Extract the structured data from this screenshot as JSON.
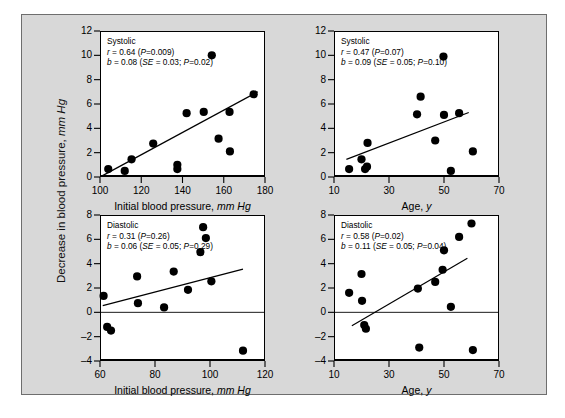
{
  "figure": {
    "y_axis_title_plain": "Decrease in blood pressure, ",
    "y_axis_title_italic": "mm Hg",
    "background_color": "#d8d8d8",
    "plot_background_color": "#ffffff",
    "point_color": "#000000",
    "axis_color": "#000000"
  },
  "chart_data": [
    {
      "id": "systolic-vs-initial-bp",
      "type": "scatter",
      "title": "Systolic",
      "annotation_lines": [
        "Systolic",
        "r = 0.64 (P=0.009)",
        "b = 0.08 (SE = 0.03; P=0.02)"
      ],
      "stats": {
        "label": "Systolic",
        "r": 0.64,
        "r_p": 0.009,
        "b": 0.08,
        "se": 0.03,
        "b_p": 0.02
      },
      "xlabel_plain": "Initial blood pressure, ",
      "xlabel_italic": "mm Hg",
      "ylabel_plain": "Decrease in blood pressure, ",
      "ylabel_italic": "mm Hg",
      "xlim": [
        100,
        180
      ],
      "ylim": [
        0,
        12
      ],
      "xticks": [
        100,
        120,
        140,
        160,
        180
      ],
      "yticks": [
        0,
        2,
        4,
        6,
        8,
        10,
        12
      ],
      "grid": false,
      "zero_line": false,
      "fit_line": {
        "x1": 100.6,
        "y1": 0.05,
        "x2": 176.5,
        "y2": 7.0
      },
      "points": [
        {
          "x": 104.0,
          "y": 0.65
        },
        {
          "x": 112.0,
          "y": 0.5
        },
        {
          "x": 115.3,
          "y": 1.45
        },
        {
          "x": 125.8,
          "y": 2.75
        },
        {
          "x": 137.5,
          "y": 1.0
        },
        {
          "x": 137.5,
          "y": 0.65
        },
        {
          "x": 142.0,
          "y": 5.25
        },
        {
          "x": 150.3,
          "y": 5.35
        },
        {
          "x": 154.2,
          "y": 10.0
        },
        {
          "x": 157.5,
          "y": 3.15
        },
        {
          "x": 162.8,
          "y": 5.35
        },
        {
          "x": 163.0,
          "y": 2.1
        },
        {
          "x": 174.5,
          "y": 6.8
        }
      ]
    },
    {
      "id": "systolic-vs-age",
      "type": "scatter",
      "title": "Systolic",
      "annotation_lines": [
        "Systolic",
        "r = 0.47 (P=0.07)",
        "b = 0.09 (SE = 0.05; P=0.10)"
      ],
      "stats": {
        "label": "Systolic",
        "r": 0.47,
        "r_p": 0.07,
        "b": 0.09,
        "se": 0.05,
        "b_p": 0.1
      },
      "xlabel_plain": "Age, ",
      "xlabel_italic": "y",
      "ylabel_plain": "Decrease in blood pressure, ",
      "ylabel_italic": "mm Hg",
      "xlim": [
        10,
        70
      ],
      "ylim": [
        0,
        12
      ],
      "xticks": [
        10,
        30,
        50,
        70
      ],
      "yticks": [
        0,
        2,
        4,
        6,
        8,
        10,
        12
      ],
      "grid": false,
      "zero_line": false,
      "fit_line": {
        "x1": 14.5,
        "y1": 1.45,
        "x2": 59.0,
        "y2": 5.3
      },
      "points": [
        {
          "x": 15.5,
          "y": 0.65
        },
        {
          "x": 20.0,
          "y": 1.45
        },
        {
          "x": 21.3,
          "y": 0.65
        },
        {
          "x": 22.0,
          "y": 0.85
        },
        {
          "x": 22.2,
          "y": 2.8
        },
        {
          "x": 40.2,
          "y": 5.15
        },
        {
          "x": 41.5,
          "y": 6.6
        },
        {
          "x": 46.8,
          "y": 3.0
        },
        {
          "x": 49.8,
          "y": 9.9
        },
        {
          "x": 50.0,
          "y": 5.1
        },
        {
          "x": 52.5,
          "y": 0.5
        },
        {
          "x": 55.5,
          "y": 5.25
        },
        {
          "x": 60.5,
          "y": 2.1
        }
      ]
    },
    {
      "id": "diastolic-vs-initial-bp",
      "type": "scatter",
      "title": "Diastolic",
      "annotation_lines": [
        "Diastolic",
        "r = 0.31 (P=0.26)",
        "b = 0.06 (SE = 0.05; P=0.29)"
      ],
      "stats": {
        "label": "Diastolic",
        "r": 0.31,
        "r_p": 0.26,
        "b": 0.06,
        "se": 0.05,
        "b_p": 0.29
      },
      "xlabel_plain": "Initial blood pressure, ",
      "xlabel_italic": "mm Hg",
      "ylabel_plain": "Decrease in blood pressure, ",
      "ylabel_italic": "mm Hg",
      "xlim": [
        60,
        120
      ],
      "ylim": [
        -4,
        8
      ],
      "xticks": [
        60,
        80,
        100,
        120
      ],
      "yticks": [
        -4,
        -2,
        0,
        2,
        4,
        6,
        8
      ],
      "grid": false,
      "zero_line": true,
      "fit_line": {
        "x1": 61.0,
        "y1": 0.55,
        "x2": 112.0,
        "y2": 3.55
      },
      "points": [
        {
          "x": 61.3,
          "y": 1.35
        },
        {
          "x": 62.6,
          "y": -1.2
        },
        {
          "x": 64.0,
          "y": -1.5
        },
        {
          "x": 73.5,
          "y": 2.95
        },
        {
          "x": 73.8,
          "y": 0.75
        },
        {
          "x": 83.3,
          "y": 0.4
        },
        {
          "x": 86.8,
          "y": 3.35
        },
        {
          "x": 92.0,
          "y": 1.85
        },
        {
          "x": 96.5,
          "y": 4.95
        },
        {
          "x": 97.5,
          "y": 7.0
        },
        {
          "x": 98.5,
          "y": 6.1
        },
        {
          "x": 100.5,
          "y": 2.55
        },
        {
          "x": 112.0,
          "y": -3.15
        }
      ]
    },
    {
      "id": "diastolic-vs-age",
      "type": "scatter",
      "title": "Diastolic",
      "annotation_lines": [
        "Diastolic",
        "r = 0.58 (P=0.02)",
        "b = 0.11 (SE = 0.05; P=0.04)"
      ],
      "stats": {
        "label": "Diastolic",
        "r": 0.58,
        "r_p": 0.02,
        "b": 0.11,
        "se": 0.05,
        "b_p": 0.04
      },
      "xlabel_plain": "Age, ",
      "xlabel_italic": "y",
      "ylabel_plain": "Decrease in blood pressure, ",
      "ylabel_italic": "mm Hg",
      "xlim": [
        10,
        70
      ],
      "ylim": [
        -4,
        8
      ],
      "xticks": [
        10,
        30,
        50,
        70
      ],
      "yticks": [
        -4,
        -2,
        0,
        2,
        4,
        6,
        8
      ],
      "grid": false,
      "zero_line": true,
      "fit_line": {
        "x1": 16.5,
        "y1": -1.1,
        "x2": 58.5,
        "y2": 4.45
      },
      "points": [
        {
          "x": 15.5,
          "y": 1.6
        },
        {
          "x": 20.0,
          "y": 3.15
        },
        {
          "x": 20.2,
          "y": 0.95
        },
        {
          "x": 21.0,
          "y": -1.05
        },
        {
          "x": 21.6,
          "y": -1.35
        },
        {
          "x": 40.5,
          "y": 1.95
        },
        {
          "x": 41.0,
          "y": -2.9
        },
        {
          "x": 46.8,
          "y": 2.5
        },
        {
          "x": 49.5,
          "y": 3.5
        },
        {
          "x": 50.0,
          "y": 5.1
        },
        {
          "x": 52.5,
          "y": 0.45
        },
        {
          "x": 55.5,
          "y": 6.2
        },
        {
          "x": 60.0,
          "y": 7.3
        },
        {
          "x": 60.5,
          "y": -3.1
        }
      ]
    }
  ]
}
